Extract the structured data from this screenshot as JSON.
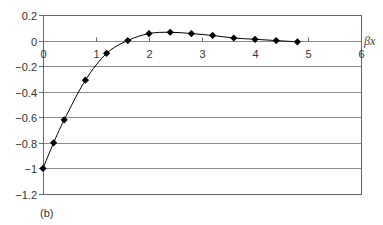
{
  "chart_data": {
    "type": "line",
    "title": "",
    "xlabel": "βx",
    "ylabel": "",
    "caption": "(b)",
    "xlim": [
      0,
      6
    ],
    "ylim": [
      -1.2,
      0.2
    ],
    "x_ticks": [
      0,
      1,
      2,
      3,
      4,
      5,
      6
    ],
    "x_tick_labels": [
      "0",
      "1",
      "2",
      "3",
      "4",
      "5",
      "6"
    ],
    "y_ticks": [
      0.2,
      0,
      -0.2,
      -0.4,
      -0.6,
      -0.8,
      -1,
      -1.2
    ],
    "y_tick_labels": [
      "0.2",
      "0",
      "-0.2",
      "-0.4",
      "-0.6",
      "-0.8",
      "-1",
      "-1.2"
    ],
    "grid": "horizontal",
    "legend": null,
    "series": [
      {
        "name": "series-1",
        "marker": "diamond",
        "color": "#000000",
        "x": [
          0,
          0.2,
          0.4,
          0.8,
          1.2,
          1.6,
          2.0,
          2.4,
          2.8,
          3.2,
          3.6,
          4.0,
          4.4,
          4.8
        ],
        "values": [
          -1.0,
          -0.8,
          -0.62,
          -0.31,
          -0.1,
          0.0,
          0.055,
          0.065,
          0.055,
          0.04,
          0.02,
          0.01,
          0.0,
          -0.01
        ]
      }
    ]
  },
  "colors": {
    "grid": "#8a8a8a",
    "frame": "#666666",
    "line": "#000000"
  }
}
